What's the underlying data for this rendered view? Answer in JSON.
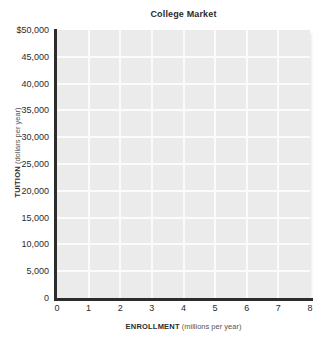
{
  "chart_data": {
    "type": "line",
    "title": "College Market",
    "xlabel_bold": "ENROLLMENT",
    "xlabel_unit": "(millions per year)",
    "ylabel_bold": "TUITION",
    "ylabel_unit": "(dollars per year)",
    "xlim": [
      0,
      8
    ],
    "ylim": [
      0,
      50000
    ],
    "x_ticks": [
      "0",
      "1",
      "2",
      "3",
      "4",
      "5",
      "6",
      "7",
      "8"
    ],
    "x_tick_values": [
      0,
      1,
      2,
      3,
      4,
      5,
      6,
      7,
      8
    ],
    "y_ticks": [
      "$50,000",
      "45,000",
      "40,000",
      "35,000",
      "30,000",
      "25,000",
      "20,000",
      "15,000",
      "10,000",
      "5,000",
      "0"
    ],
    "y_tick_values": [
      50000,
      45000,
      40000,
      35000,
      30000,
      25000,
      20000,
      15000,
      10000,
      5000,
      0
    ],
    "grid": true,
    "legend": null,
    "series": [],
    "values": [],
    "categories": [],
    "annotations": [],
    "note": "Empty plotting grid with no data series drawn",
    "colors": {
      "plot_background": "#ebebeb",
      "gridline": "#fbfbfb",
      "axis": "#2c2c2c",
      "text": "#2b2b2b",
      "page_background": "#ffffff"
    }
  }
}
